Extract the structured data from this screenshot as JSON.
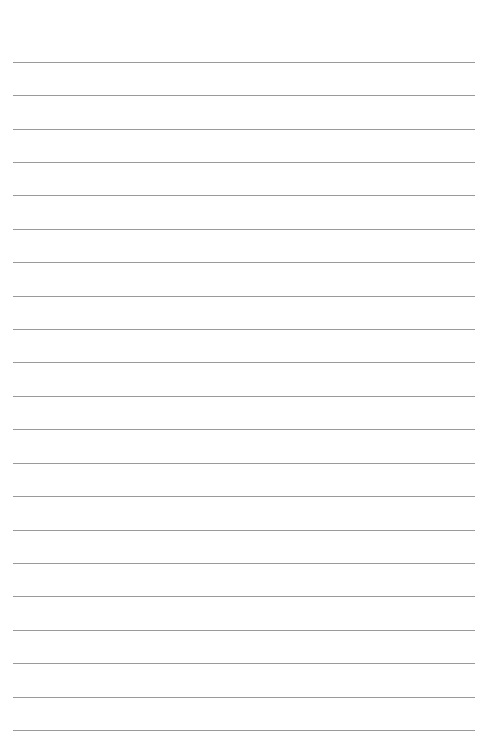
{
  "page": {
    "type": "lined-paper",
    "background_color": "#ffffff",
    "line_color": "#9a9a9a",
    "line_count": 21,
    "line_positions_y": [
      62,
      95,
      129,
      162,
      195,
      229,
      262,
      296,
      329,
      362,
      396,
      429,
      463,
      496,
      530,
      563,
      596,
      630,
      663,
      697,
      730
    ],
    "line_left_x": 13,
    "line_right_x": 475
  }
}
